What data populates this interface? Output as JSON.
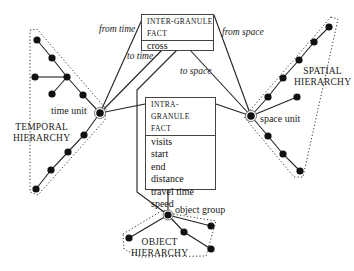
{
  "inter_granule_fact": {
    "title_line1": "INTER-GRANULE",
    "title_line2": "FACT",
    "measures": [
      "cross"
    ]
  },
  "intra_granule_fact": {
    "title_line1": "INTRA-GRANULE",
    "title_line2": "FACT",
    "measures": [
      "visits",
      "start",
      "end",
      "distance",
      "travel time",
      "speed"
    ]
  },
  "edge_labels": {
    "from_time": "from time",
    "to_time": "to time",
    "from_space": "from space",
    "to_space": "to space"
  },
  "node_labels": {
    "time_unit": "time unit",
    "space_unit": "space unit",
    "object_group": "object group"
  },
  "hierarchies": {
    "temporal": {
      "line1": "TEMPORAL",
      "line2": "HIERARCHY"
    },
    "spatial": {
      "line1": "SPATIAL",
      "line2": "HIERARCHY"
    },
    "object": {
      "line1": "OBJECT",
      "line2": "HIERARCHY"
    }
  }
}
